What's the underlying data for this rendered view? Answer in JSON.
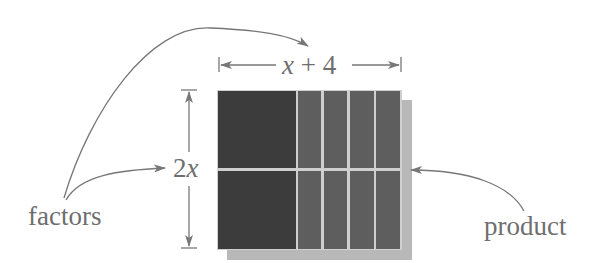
{
  "diagram": {
    "labels": {
      "width": "x + 4",
      "width_var": "x",
      "width_rest": "+ 4",
      "height": "2x",
      "height_coef": "2",
      "height_var": "x",
      "factors": "factors",
      "product": "product"
    },
    "grid": {
      "rows": 2,
      "columns": [
        "x",
        "1",
        "1",
        "1",
        "1"
      ],
      "tiles": [
        [
          "x-squared",
          "x",
          "x",
          "x",
          "x"
        ],
        [
          "x-squared",
          "x",
          "x",
          "x",
          "x"
        ]
      ]
    },
    "colors": {
      "large_tile": "#3c3c3c",
      "strip_tile": "#5e5e5e",
      "gap": "#cfcfcf",
      "shadow": "#b5b5b5",
      "line": "#777777",
      "text": "#6e6e6e"
    }
  }
}
